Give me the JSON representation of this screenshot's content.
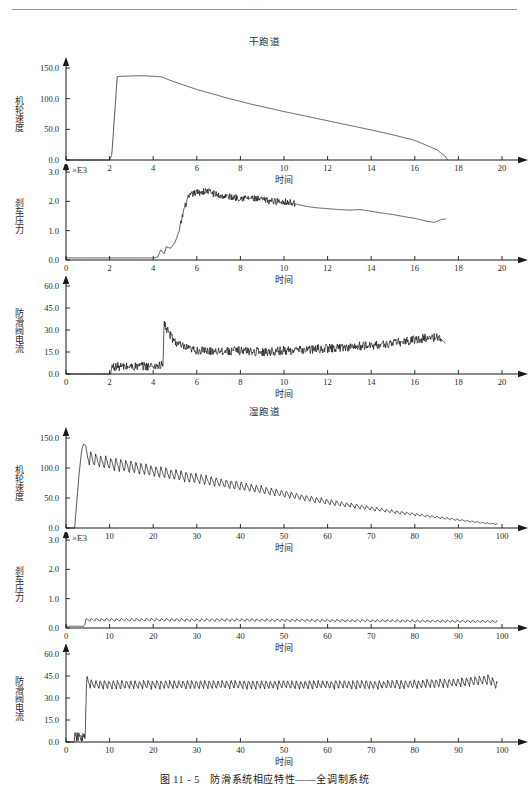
{
  "header": {
    "rule_visible": true,
    "faint_text": "· · · · ·"
  },
  "caption": "图 11 - 5 防滑系统相应特性——全调制系统",
  "sections": [
    {
      "title": "干跑道"
    },
    {
      "title": "湿跑道"
    }
  ],
  "chart_data": [
    {
      "type": "line",
      "title": "干跑道",
      "xlabel": "时间",
      "ylabel": "机轮速度",
      "multiplier": "",
      "xlim": [
        0,
        20
      ],
      "ylim": [
        0,
        150
      ],
      "xticks": [
        0,
        2,
        4,
        6,
        8,
        10,
        12,
        14,
        16,
        18,
        20
      ],
      "xticklabels": [
        "0",
        "2",
        "4",
        "6",
        "8",
        "10",
        "12",
        "14",
        "16",
        "18",
        "20"
      ],
      "yticks": [
        0,
        50,
        100,
        150
      ],
      "yticklabels": [
        "0.0",
        "50.0",
        "100.0",
        "150.0"
      ],
      "grid": false,
      "legend": "none",
      "series": [
        {
          "name": "机轮速度",
          "noise": 0.0,
          "x": [
            0,
            2.0,
            2.1,
            2.35,
            2.6,
            3.0,
            3.5,
            4.0,
            4.4,
            4.5,
            4.7,
            5.0,
            5.5,
            6.0,
            6.5,
            7.0,
            7.5,
            8.0,
            8.5,
            9.0,
            9.5,
            10.0,
            11.0,
            12.0,
            13.0,
            14.0,
            15.0,
            16.0,
            17.0,
            17.4,
            17.5
          ],
          "y": [
            0,
            0,
            8,
            136,
            136.5,
            137,
            137.5,
            136.5,
            135.5,
            134,
            131,
            127,
            121,
            115,
            110,
            105,
            100,
            95.5,
            91,
            87,
            83,
            79,
            71.5,
            64,
            56.5,
            49,
            41,
            32,
            17,
            6,
            0
          ]
        }
      ]
    },
    {
      "type": "line",
      "title": "干跑道",
      "xlabel": "时间",
      "ylabel": "刹车压力",
      "multiplier": "×E3",
      "xlim": [
        0,
        20
      ],
      "ylim": [
        0,
        3.0
      ],
      "xticks": [
        0,
        2,
        4,
        6,
        8,
        10,
        12,
        14,
        16,
        18,
        20
      ],
      "xticklabels": [
        "0",
        "2",
        "4",
        "6",
        "8",
        "10",
        "12",
        "14",
        "16",
        "18",
        "20"
      ],
      "yticks": [
        0,
        1.0,
        2.0,
        3.0
      ],
      "yticklabels": [
        "0.0",
        "1.0",
        "2.0",
        "3.0"
      ],
      "grid": false,
      "legend": "none",
      "series": [
        {
          "name": "刹车压力",
          "noise": 0.12,
          "noise_start": 5.2,
          "noise_end": 10.5,
          "x": [
            0,
            4.0,
            4.2,
            4.35,
            4.5,
            4.6,
            4.8,
            5.0,
            5.2,
            5.4,
            5.6,
            5.8,
            6.0,
            6.5,
            7.0,
            7.5,
            8.0,
            8.5,
            9.0,
            9.5,
            10.0,
            10.5,
            11.0,
            11.5,
            12.0,
            12.5,
            13.0,
            13.5,
            14.0,
            14.5,
            15.0,
            15.5,
            16.0,
            16.5,
            16.9,
            17.2,
            17.4
          ],
          "y": [
            0.07,
            0.07,
            0.1,
            0.35,
            0.2,
            0.45,
            0.4,
            0.6,
            1.0,
            1.7,
            2.1,
            2.25,
            2.3,
            2.35,
            2.2,
            2.15,
            2.12,
            2.1,
            2.05,
            2.0,
            2.0,
            1.92,
            1.83,
            1.78,
            1.75,
            1.72,
            1.7,
            1.72,
            1.66,
            1.6,
            1.55,
            1.48,
            1.42,
            1.33,
            1.28,
            1.38,
            1.4
          ]
        }
      ]
    },
    {
      "type": "line",
      "title": "干跑道",
      "xlabel": "时间",
      "ylabel": "防滑阀电流",
      "multiplier": "",
      "xlim": [
        0,
        20
      ],
      "ylim": [
        0,
        60
      ],
      "xticks": [
        0,
        2,
        4,
        6,
        8,
        10,
        12,
        14,
        16,
        18,
        20
      ],
      "xticklabels": [
        "0",
        "2",
        "4",
        "6",
        "8",
        "10",
        "12",
        "14",
        "16",
        "18",
        "20"
      ],
      "yticks": [
        0,
        15,
        30,
        45,
        60
      ],
      "yticklabels": [
        "0.0",
        "15.0",
        "30.0",
        "45.0",
        "60.0"
      ],
      "grid": false,
      "legend": "none",
      "series": [
        {
          "name": "防滑阀电流",
          "noise": 3.0,
          "noise_start": 2.1,
          "noise_end": 17.2,
          "x": [
            0,
            2.05,
            2.1,
            3.0,
            4.0,
            4.45,
            4.5,
            4.6,
            4.8,
            5.0,
            5.3,
            5.6,
            6.0,
            6.5,
            7.0,
            7.5,
            8.0,
            8.5,
            9.0,
            9.5,
            10.0,
            10.5,
            11.0,
            11.5,
            12.0,
            12.5,
            13.0,
            13.5,
            14.0,
            14.5,
            15.0,
            15.5,
            16.0,
            16.5,
            17.0,
            17.2,
            17.4
          ],
          "y": [
            0,
            0,
            5,
            5,
            5.5,
            6,
            35,
            31,
            26,
            22,
            19,
            17,
            16,
            15.5,
            16,
            15.5,
            16,
            15.5,
            15,
            15.5,
            16,
            16,
            16.5,
            17,
            17.5,
            18,
            18.5,
            19,
            19.5,
            20,
            21,
            22,
            23.5,
            24.5,
            25,
            24,
            21
          ]
        }
      ]
    },
    {
      "type": "line",
      "title": "湿跑道",
      "xlabel": "时间",
      "ylabel": "机轮速度",
      "multiplier": "",
      "xlim": [
        0,
        100
      ],
      "ylim": [
        0,
        150
      ],
      "xticks": [
        0,
        10,
        20,
        30,
        40,
        50,
        60,
        70,
        80,
        90,
        100
      ],
      "xticklabels": [
        "0",
        "10",
        "20",
        "30",
        "40",
        "50",
        "60",
        "70",
        "80",
        "90",
        "100"
      ],
      "yticks": [
        0,
        50,
        100,
        150
      ],
      "yticklabels": [
        "0.0",
        "50.0",
        "100.0",
        "150.0"
      ],
      "grid": false,
      "legend": "none",
      "series": [
        {
          "name": "机轮速度",
          "sawtooth": true,
          "saw_start": 4.5,
          "saw_end": 99,
          "saw_period": 1.15,
          "saw_depth": 0.22,
          "x": [
            0,
            2.0,
            2.2,
            3.0,
            3.6,
            4.0,
            4.5,
            5.0,
            6.0,
            8.0,
            10.0,
            15.0,
            20.0,
            25.0,
            30.0,
            35.0,
            40.0,
            45.0,
            50.0,
            55.0,
            60.0,
            65.0,
            70.0,
            75.0,
            80.0,
            85.0,
            90.0,
            95.0,
            99.0
          ],
          "y": [
            0,
            0,
            20,
            90,
            130,
            140,
            138,
            130,
            126,
            122,
            119,
            112,
            105,
            98,
            91,
            84,
            77,
            70,
            63,
            55,
            48,
            42,
            36,
            30,
            25,
            20,
            15,
            10,
            7
          ]
        }
      ]
    },
    {
      "type": "line",
      "title": "湿跑道",
      "xlabel": "时间",
      "ylabel": "刹车压力",
      "multiplier": "×E3",
      "xlim": [
        0,
        100
      ],
      "ylim": [
        0,
        3.0
      ],
      "xticks": [
        0,
        10,
        20,
        30,
        40,
        50,
        60,
        70,
        80,
        90,
        100
      ],
      "xticklabels": [
        "0",
        "10",
        "20",
        "30",
        "40",
        "50",
        "60",
        "70",
        "80",
        "90",
        "100"
      ],
      "yticks": [
        0,
        1.0,
        2.0,
        3.0
      ],
      "yticklabels": [
        "0.0",
        "1.0",
        "2.0",
        "3.0"
      ],
      "grid": false,
      "legend": "none",
      "series": [
        {
          "name": "刹车压力",
          "sawtooth": true,
          "saw_start": 4.6,
          "saw_end": 99,
          "saw_period": 1.15,
          "saw_depth": 0.35,
          "x": [
            0,
            4.0,
            4.3,
            4.6,
            5.0,
            10.0,
            20.0,
            30.0,
            40.0,
            50.0,
            60.0,
            70.0,
            80.0,
            90.0,
            99.0
          ],
          "y": [
            0.06,
            0.06,
            0.1,
            0.33,
            0.33,
            0.33,
            0.33,
            0.32,
            0.32,
            0.31,
            0.3,
            0.29,
            0.28,
            0.27,
            0.26
          ]
        }
      ]
    },
    {
      "type": "line",
      "title": "湿跑道",
      "xlabel": "时间",
      "ylabel": "防滑阀电流",
      "multiplier": "",
      "xlim": [
        0,
        100
      ],
      "ylim": [
        0,
        60
      ],
      "xticks": [
        0,
        10,
        20,
        30,
        40,
        50,
        60,
        70,
        80,
        90,
        100
      ],
      "xticklabels": [
        "0",
        "10",
        "20",
        "30",
        "40",
        "50",
        "60",
        "70",
        "80",
        "90",
        "100"
      ],
      "yticks": [
        0,
        15,
        30,
        45,
        60
      ],
      "yticklabels": [
        "0.0",
        "15.0",
        "30.0",
        "45.0",
        "60.0"
      ],
      "grid": false,
      "legend": "none",
      "series": [
        {
          "name": "防滑阀电流",
          "sawtooth": true,
          "saw_start": 4.8,
          "saw_end": 99,
          "saw_period": 1.0,
          "saw_depth": 0.16,
          "pre_noise_start": 2.0,
          "pre_noise_end": 4.4,
          "pre_noise_level": 3.0,
          "x": [
            0,
            2.0,
            2.2,
            4.0,
            4.4,
            4.6,
            4.8,
            5.0,
            6.0,
            10.0,
            20.0,
            30.0,
            40.0,
            50.0,
            60.0,
            70.0,
            80.0,
            85.0,
            90.0,
            95.0,
            97.0,
            99.0
          ],
          "y": [
            0,
            0,
            2,
            2.5,
            2,
            30,
            46,
            44,
            42,
            42,
            42,
            42,
            42,
            42,
            42,
            42,
            42.5,
            43,
            43.5,
            45,
            46,
            41
          ]
        }
      ]
    }
  ]
}
